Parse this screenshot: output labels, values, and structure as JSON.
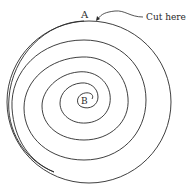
{
  "diagram": {
    "labels": {
      "start_point": "A",
      "center_point": "B",
      "instruction": "Cut here"
    },
    "shapes": {
      "outer_circle": {
        "cx": 89,
        "cy": 102,
        "r": 82
      },
      "spiral": {
        "from": "B",
        "to": "A",
        "turns": 4
      }
    },
    "colors": {
      "stroke": "#2a2a2a",
      "background": "#ffffff"
    }
  }
}
